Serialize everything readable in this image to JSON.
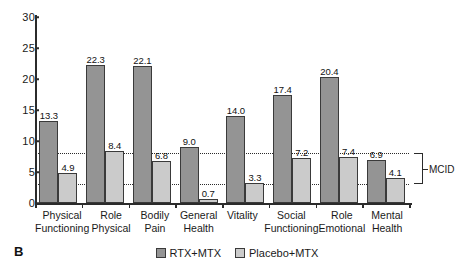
{
  "panel": {
    "letter": "B"
  },
  "legend": {
    "items": [
      {
        "label": "RTX+MTX",
        "color": "#949494",
        "icon": "legend-swatch"
      },
      {
        "label": "Placebo+MTX",
        "color": "#cbcbcb",
        "icon": "legend-swatch"
      }
    ]
  },
  "annotations": {
    "mcid_label": "MCID",
    "mcid_lower": 3.0,
    "mcid_upper": 8.1
  },
  "chart_data": {
    "type": "bar",
    "title": "",
    "xlabel": "",
    "ylabel": "",
    "ylim": [
      0,
      30
    ],
    "yticks": [
      0,
      5,
      10,
      15,
      20,
      25,
      30
    ],
    "ytick_labels": [
      "0",
      "5",
      "10",
      "15",
      "20",
      "25",
      "30"
    ],
    "grid": false,
    "legend_position": "bottom-center",
    "categories": [
      "Physical\nFunctioning",
      "Role\nPhysical",
      "Bodily\nPain",
      "General\nHealth",
      "Vitality",
      "Social\nFunctioning",
      "Role\nEmotional",
      "Mental\nHealth"
    ],
    "category_lines": [
      [
        "Physical",
        "Functioning"
      ],
      [
        "Role",
        "Physical"
      ],
      [
        "Bodily",
        "Pain"
      ],
      [
        "General",
        "Health"
      ],
      [
        "Vitality",
        ""
      ],
      [
        "Social",
        "Functioning"
      ],
      [
        "Role",
        "Emotional"
      ],
      [
        "Mental",
        "Health"
      ]
    ],
    "series": [
      {
        "name": "RTX+MTX",
        "color": "#949494",
        "values": [
          13.3,
          22.3,
          22.1,
          9.0,
          14.0,
          17.4,
          20.4,
          6.9
        ],
        "value_labels": [
          "13.3",
          "22.3",
          "22.1",
          "9.0",
          "14.0",
          "17.4",
          "20.4",
          "6.9"
        ]
      },
      {
        "name": "Placebo+MTX",
        "color": "#cbcbcb",
        "values": [
          4.9,
          8.4,
          6.8,
          0.7,
          3.3,
          7.2,
          7.4,
          4.1
        ],
        "value_labels": [
          "4.9",
          "8.4",
          "6.8",
          "0.7",
          "3.3",
          "7.2",
          "7.4",
          "4.1"
        ]
      }
    ],
    "reference_lines": [
      {
        "y": 8.1,
        "style": "dotted",
        "label": "MCID upper"
      },
      {
        "y": 3.0,
        "style": "dotted",
        "label": "MCID lower"
      }
    ]
  }
}
